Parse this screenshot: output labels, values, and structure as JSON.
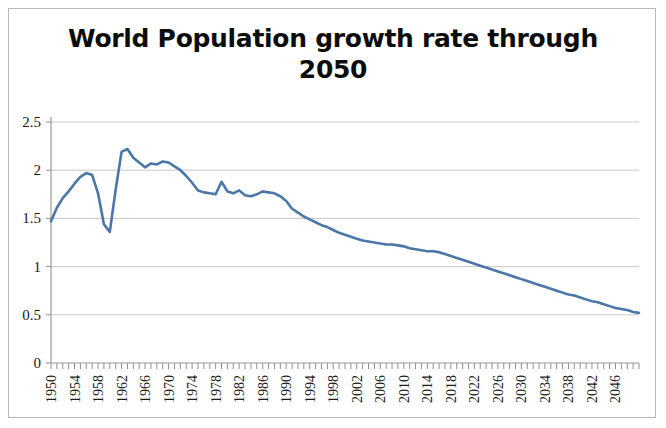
{
  "chart_data": {
    "type": "line",
    "title": "World Population growth rate through\n2050",
    "title_line1": "World Population growth rate through",
    "title_line2": "2050",
    "xlabel": "",
    "ylabel": "",
    "ylim": [
      0,
      2.5
    ],
    "xlim": [
      1950,
      2050
    ],
    "grid": true,
    "legend": "none",
    "y_ticks": [
      "0",
      "0.5",
      "1",
      "1.5",
      "2",
      "2.5"
    ],
    "y_tick_values": [
      0,
      0.5,
      1,
      1.5,
      2,
      2.5
    ],
    "x_tick_labels": [
      "1950",
      "1954",
      "1958",
      "1962",
      "1966",
      "1970",
      "1974",
      "1978",
      "1982",
      "1986",
      "1990",
      "1994",
      "1998",
      "2002",
      "2006",
      "2010",
      "2014",
      "2018",
      "2022",
      "2026",
      "2030",
      "2034",
      "2038",
      "2042",
      "2046"
    ],
    "x_tick_values": [
      1950,
      1954,
      1958,
      1962,
      1966,
      1970,
      1974,
      1978,
      1982,
      1986,
      1990,
      1994,
      1998,
      2002,
      2006,
      2010,
      2014,
      2018,
      2022,
      2026,
      2030,
      2034,
      2038,
      2042,
      2046
    ],
    "x_label_rotation_deg": -90,
    "series": [
      {
        "name": "World population growth rate",
        "color": "#4a77a8",
        "x": [
          1950,
          1951,
          1952,
          1953,
          1954,
          1955,
          1956,
          1957,
          1958,
          1959,
          1960,
          1961,
          1962,
          1963,
          1964,
          1965,
          1966,
          1967,
          1968,
          1969,
          1970,
          1971,
          1972,
          1973,
          1974,
          1975,
          1976,
          1977,
          1978,
          1979,
          1980,
          1981,
          1982,
          1983,
          1984,
          1985,
          1986,
          1987,
          1988,
          1989,
          1990,
          1991,
          1992,
          1993,
          1994,
          1995,
          1996,
          1997,
          1998,
          1999,
          2000,
          2001,
          2002,
          2003,
          2004,
          2005,
          2006,
          2007,
          2008,
          2009,
          2010,
          2011,
          2012,
          2013,
          2014,
          2015,
          2016,
          2017,
          2018,
          2019,
          2020,
          2021,
          2022,
          2023,
          2024,
          2025,
          2026,
          2027,
          2028,
          2029,
          2030,
          2031,
          2032,
          2033,
          2034,
          2035,
          2036,
          2037,
          2038,
          2039,
          2040,
          2041,
          2042,
          2043,
          2044,
          2045,
          2046,
          2047,
          2048,
          2049,
          2050
        ],
        "y": [
          1.47,
          1.61,
          1.71,
          1.78,
          1.86,
          1.93,
          1.97,
          1.95,
          1.76,
          1.44,
          1.36,
          1.8,
          2.19,
          2.22,
          2.13,
          2.08,
          2.03,
          2.07,
          2.06,
          2.09,
          2.08,
          2.04,
          2.0,
          1.94,
          1.87,
          1.79,
          1.77,
          1.76,
          1.75,
          1.88,
          1.78,
          1.76,
          1.79,
          1.74,
          1.73,
          1.75,
          1.78,
          1.77,
          1.76,
          1.73,
          1.68,
          1.6,
          1.56,
          1.52,
          1.49,
          1.46,
          1.43,
          1.41,
          1.38,
          1.35,
          1.33,
          1.31,
          1.29,
          1.27,
          1.26,
          1.25,
          1.24,
          1.23,
          1.23,
          1.22,
          1.21,
          1.19,
          1.18,
          1.17,
          1.16,
          1.16,
          1.15,
          1.13,
          1.11,
          1.09,
          1.07,
          1.05,
          1.03,
          1.01,
          0.99,
          0.97,
          0.95,
          0.93,
          0.91,
          0.89,
          0.87,
          0.85,
          0.83,
          0.81,
          0.79,
          0.77,
          0.75,
          0.73,
          0.71,
          0.7,
          0.68,
          0.66,
          0.64,
          0.63,
          0.61,
          0.59,
          0.57,
          0.56,
          0.55,
          0.53,
          0.52
        ]
      }
    ]
  },
  "style": {
    "line_color": "#4a77a8",
    "grid_color": "#c8c8c8",
    "axis_color": "#9a9a9a",
    "border_color": "#b9b9b9",
    "text_color": "#1a1a1a",
    "background": "#ffffff"
  }
}
